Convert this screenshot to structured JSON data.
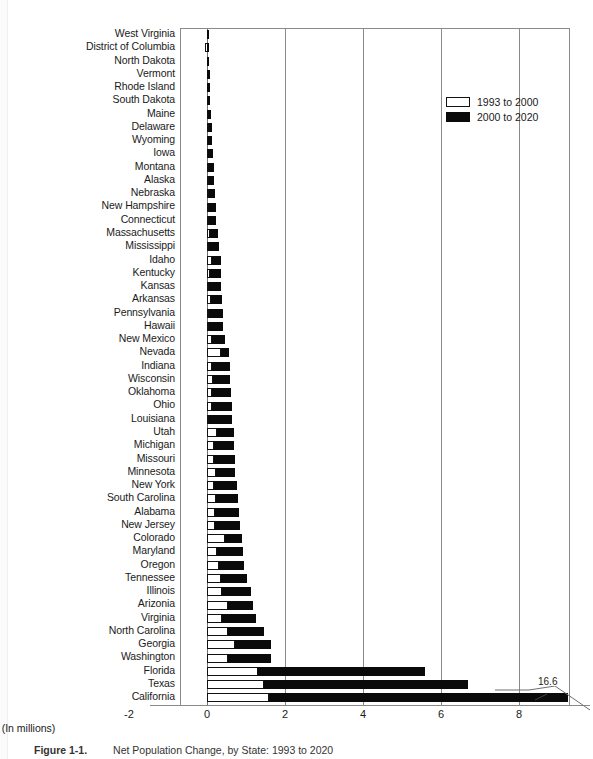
{
  "figure": {
    "caption_number": "Figure 1-1.",
    "caption_text": "Net Population Change, by State: 1993 to 2020",
    "xaxis_title": "(In millions)"
  },
  "legend": {
    "position": "top-right",
    "items": [
      {
        "label": "1993 to 2000",
        "color": "#ffffff",
        "name": "period-1993-2000"
      },
      {
        "label": "2000 to 2020",
        "color": "#0a0a0a",
        "name": "period-2000-2020"
      }
    ]
  },
  "annotation": {
    "california_total": "16.6"
  },
  "chart_data": {
    "type": "bar",
    "orientation": "horizontal",
    "stacked": true,
    "title": "Net Population Change, by State: 1993 to 2020",
    "xlabel": "(In millions)",
    "ylabel": "",
    "xlim": [
      -2,
      8
    ],
    "xticks": [
      -2,
      0,
      2,
      4,
      6,
      8
    ],
    "grid": true,
    "legend_position": "top-right",
    "note": "California's bar is broken; its total is 16.6 million.",
    "categories": [
      "West Virginia",
      "District of Columbia",
      "North Dakota",
      "Vermont",
      "Rhode Island",
      "South Dakota",
      "Maine",
      "Delaware",
      "Wyoming",
      "Iowa",
      "Montana",
      "Alaska",
      "Nebraska",
      "New Hampshire",
      "Connecticut",
      "Massachusetts",
      "Mississippi",
      "Idaho",
      "Kentucky",
      "Kansas",
      "Arkansas",
      "Pennsylvania",
      "Hawaii",
      "New Mexico",
      "Nevada",
      "Indiana",
      "Wisconsin",
      "Oklahoma",
      "Ohio",
      "Louisiana",
      "Utah",
      "Michigan",
      "Missouri",
      "Minnesota",
      "New York",
      "South Carolina",
      "Alabama",
      "New Jersey",
      "Colorado",
      "Maryland",
      "Oregon",
      "Tennessee",
      "Illinois",
      "Arizonia",
      "Virginia",
      "North Carolina",
      "Georgia",
      "Washington",
      "Florida",
      "Texas",
      "California"
    ],
    "series": [
      {
        "name": "1993 to 2000",
        "color": "#ffffff",
        "values": [
          -0.01,
          -0.04,
          -0.01,
          0.01,
          0.01,
          0.02,
          0.02,
          0.04,
          0.02,
          0.03,
          0.05,
          0.04,
          0.04,
          0.06,
          0.05,
          0.07,
          0.06,
          0.14,
          0.08,
          0.06,
          0.1,
          0.06,
          0.05,
          0.13,
          0.35,
          0.14,
          0.16,
          0.14,
          0.12,
          0.05,
          0.26,
          0.17,
          0.18,
          0.22,
          0.18,
          0.24,
          0.2,
          0.2,
          0.47,
          0.26,
          0.32,
          0.36,
          0.38,
          0.55,
          0.38,
          0.53,
          0.72,
          0.55,
          1.3,
          1.45,
          1.6
        ]
      },
      {
        "name": "2000 to 2020",
        "color": "#0a0a0a",
        "values": [
          0.02,
          0.02,
          0.03,
          0.05,
          0.05,
          0.07,
          0.09,
          0.1,
          0.11,
          0.13,
          0.13,
          0.15,
          0.16,
          0.16,
          0.19,
          0.22,
          0.26,
          0.21,
          0.28,
          0.31,
          0.29,
          0.35,
          0.37,
          0.33,
          0.22,
          0.44,
          0.44,
          0.47,
          0.51,
          0.59,
          0.42,
          0.52,
          0.53,
          0.51,
          0.58,
          0.56,
          0.62,
          0.65,
          0.42,
          0.66,
          0.64,
          0.67,
          0.74,
          0.64,
          0.88,
          0.92,
          0.93,
          1.09,
          4.3,
          5.25,
          15.0
        ]
      }
    ],
    "totals": [
      0.01,
      -0.02,
      0.02,
      0.06,
      0.06,
      0.09,
      0.11,
      0.14,
      0.13,
      0.16,
      0.18,
      0.19,
      0.2,
      0.22,
      0.24,
      0.29,
      0.32,
      0.35,
      0.36,
      0.37,
      0.39,
      0.41,
      0.42,
      0.46,
      0.57,
      0.58,
      0.6,
      0.61,
      0.63,
      0.64,
      0.68,
      0.69,
      0.71,
      0.73,
      0.76,
      0.8,
      0.82,
      0.85,
      0.89,
      0.92,
      0.96,
      1.03,
      1.12,
      1.19,
      1.26,
      1.45,
      1.65,
      1.64,
      5.6,
      6.7,
      16.6
    ]
  }
}
